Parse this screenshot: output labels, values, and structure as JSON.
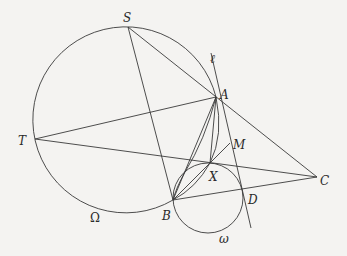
{
  "diagram": {
    "type": "geometry-figure",
    "background": "#f4f3f1",
    "stroke_color": "#3a3a3a",
    "points": {
      "S": {
        "label": "S",
        "x": 128,
        "y": 27
      },
      "A": {
        "label": "A",
        "x": 216,
        "y": 97
      },
      "T": {
        "label": "T",
        "x": 35,
        "y": 139
      },
      "C": {
        "label": "C",
        "x": 317,
        "y": 177
      },
      "M": {
        "label": "M",
        "x": 230,
        "y": 143
      },
      "X": {
        "label": "X",
        "x": 210,
        "y": 163
      },
      "B": {
        "label": "B",
        "x": 173,
        "y": 200
      },
      "D": {
        "label": "D",
        "x": 242,
        "y": 190
      }
    },
    "circles": {
      "Omega": {
        "label": "Ω",
        "cx": 125,
        "cy": 120,
        "r": 93
      },
      "omega": {
        "label": "ω",
        "cx": 208,
        "cy": 198,
        "r": 35
      }
    },
    "line_ell": {
      "label": "ℓ"
    },
    "segments": [
      "S-C",
      "S-B",
      "T-A",
      "T-C",
      "B-C",
      "A-B",
      "A-X",
      "B-M",
      "ell"
    ]
  }
}
